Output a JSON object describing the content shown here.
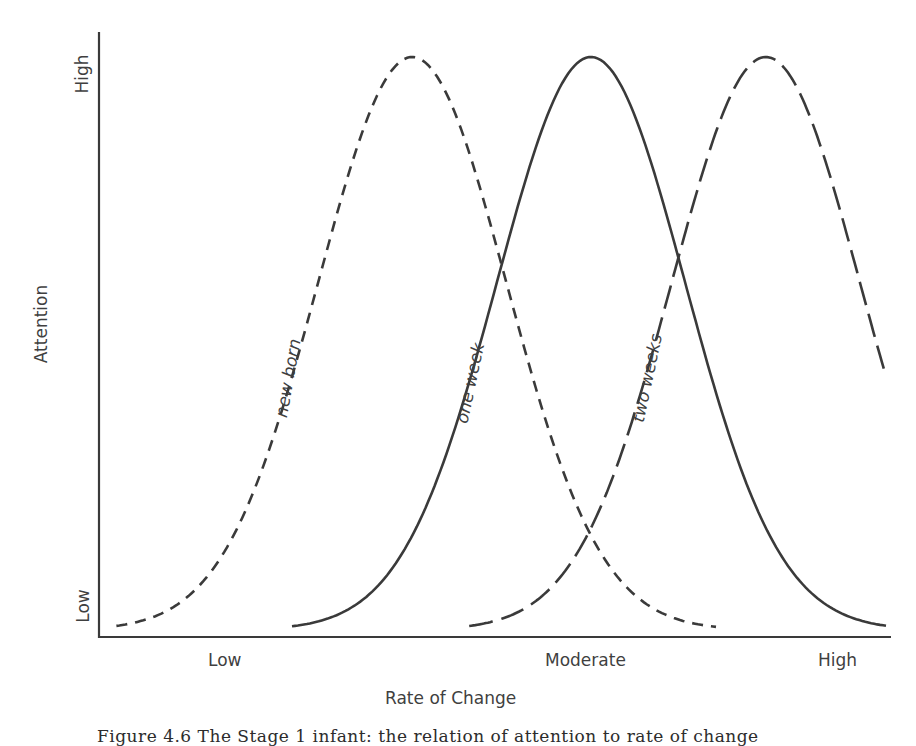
{
  "figure": {
    "caption": "Figure 4.6 The Stage 1 infant: the relation of attention to rate of change",
    "y_axis_label": "Attention",
    "x_axis_label": "Rate of Change",
    "y_ticks": {
      "low": "Low",
      "high": "High"
    },
    "x_ticks": {
      "low": "Low",
      "moderate": "Moderate",
      "high": "High"
    },
    "curve_labels": {
      "newborn": "new born",
      "one_week": "one week",
      "two_weeks": "two weeks"
    },
    "line_color": "#3a3a3a"
  },
  "chart_data": {
    "type": "line",
    "title": "",
    "xlabel": "Rate of Change",
    "ylabel": "Attention",
    "x_tick_labels": [
      "Low",
      "Moderate",
      "High"
    ],
    "y_tick_labels": [
      "Low",
      "High"
    ],
    "x_range": [
      0,
      1
    ],
    "y_range": [
      0,
      1
    ],
    "grid": false,
    "legend": "inline labels along curves",
    "series": [
      {
        "name": "new born",
        "style": "short-dash",
        "peak_x": 0.396,
        "peak_y": 1.0,
        "sigma": 0.119,
        "x_start": 0.022,
        "x_end": 0.78,
        "pixel_center": 413
      },
      {
        "name": "one week",
        "style": "solid",
        "peak_x": 0.622,
        "peak_y": 1.0,
        "sigma": 0.119,
        "x_start": 0.244,
        "x_end": 0.995,
        "pixel_center": 592
      },
      {
        "name": "two weeks",
        "style": "long-dash",
        "peak_x": 0.843,
        "peak_y": 1.0,
        "sigma": 0.119,
        "x_start": 0.468,
        "x_end": 0.995,
        "pixel_center": 766
      }
    ]
  }
}
